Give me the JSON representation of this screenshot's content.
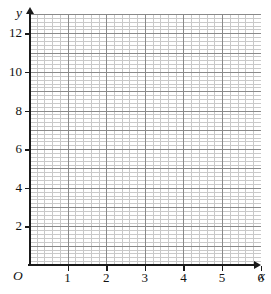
{
  "figure": {
    "kind": "blank-coordinate-grid",
    "origin_label": "O",
    "x_axis_label": "x",
    "y_axis_label": "y",
    "background_color": "#ffffff",
    "axis_color": "#1a1a1a",
    "major_grid_color": "#8a8a8a",
    "minor_grid_color": "#c9c9c9"
  },
  "chart_data": {
    "type": "scatter",
    "title": "",
    "xlabel": "x",
    "ylabel": "y",
    "series": [
      {
        "name": "",
        "x": [],
        "y": []
      }
    ],
    "xlim": [
      0,
      6.01
    ],
    "ylim": [
      0,
      13.0
    ],
    "x_ticks": [
      1,
      2,
      3,
      4,
      5,
      6
    ],
    "y_ticks": [
      2,
      4,
      6,
      8,
      10,
      12
    ],
    "x_tick_labels": [
      "1",
      "2",
      "3",
      "4",
      "5",
      "6"
    ],
    "y_tick_labels": [
      "2",
      "4",
      "6",
      "8",
      "10",
      "12"
    ],
    "x_major_step": 1,
    "y_major_step": 1,
    "minor_divisions_per_major": 5,
    "grid": true,
    "legend": false,
    "annotations": [
      "O"
    ]
  }
}
